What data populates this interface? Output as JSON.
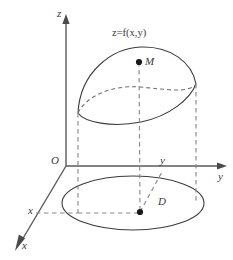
{
  "figure": {
    "kind": "3d-coordinate-diagram",
    "background_color": "#ffffff",
    "line_color": "#3c3c3c",
    "axis_color": "#5a5a5a",
    "dash_color": "#8a8a8a",
    "point_color": "#1a1a1a",
    "width": 233,
    "height": 260
  },
  "labels": {
    "z_axis": "z",
    "y_axis": "y",
    "x_axis": "x",
    "origin": "O",
    "surface_equation": "z=f(x,y)",
    "surface_equation_lhs": "z",
    "surface_equation_eq": "=",
    "surface_equation_fn": "f",
    "surface_equation_args": "(x,y)",
    "point_on_surface": "M",
    "region": "D",
    "y_coordinate": "y",
    "x_coordinate": "x"
  },
  "geometry": {
    "origin": {
      "x": 66,
      "y": 166
    },
    "z_axis_top": {
      "x": 66,
      "y": 18
    },
    "y_axis_end": {
      "x": 225,
      "y": 166
    },
    "x_axis_end": {
      "x": 17,
      "y": 248
    },
    "point_M": {
      "x": 139,
      "y": 62
    },
    "point_D": {
      "x": 140,
      "y": 212
    },
    "base_ellipse": {
      "cx": 133,
      "cy": 203,
      "rx": 71,
      "ry": 27
    },
    "surface_rim_ellipse": {
      "cx": 133,
      "cy": 88,
      "rx": 61,
      "ry": 23
    },
    "left_projector_x": 78,
    "right_projector_x": 196,
    "center_projector_x": 139,
    "x_tick_dashed_y": 213
  }
}
